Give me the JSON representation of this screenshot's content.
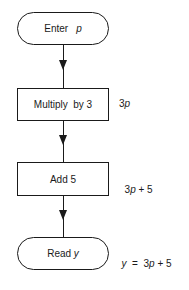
{
  "diagram": {
    "type": "flowchart",
    "nodes": [
      {
        "id": "start",
        "shape": "terminal",
        "label_text": "Enter",
        "label_var": "p",
        "annotation": ""
      },
      {
        "id": "multiply",
        "shape": "process",
        "label_text": "Multiply  by 3",
        "annotation_coef": "3",
        "annotation_var": "p",
        "annotation_rest": ""
      },
      {
        "id": "add",
        "shape": "process",
        "label_text": "Add 5",
        "annotation_coef": "3",
        "annotation_var": "p",
        "annotation_rest": " + 5"
      },
      {
        "id": "end",
        "shape": "terminal",
        "label_text": "Read",
        "label_var": "y",
        "annotation_lhs": "y",
        "annotation_eq": "  =  3",
        "annotation_var": "p",
        "annotation_rest": " + 5"
      }
    ],
    "edges": [
      {
        "from": "start",
        "to": "multiply",
        "arrow": "down"
      },
      {
        "from": "multiply",
        "to": "add",
        "arrow": "down"
      },
      {
        "from": "add",
        "to": "end",
        "arrow": "down"
      }
    ]
  }
}
